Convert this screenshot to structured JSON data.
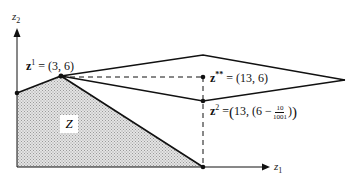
{
  "axes": {
    "x_label": "z",
    "x_sub": "1",
    "y_label": "z",
    "y_sub": "2"
  },
  "region_label": "Z",
  "points": {
    "z1": {
      "name": "z",
      "sup": "1",
      "value": "= (3, 6)"
    },
    "zss": {
      "name": "z",
      "sup": "**",
      "value": "= (13, 6)"
    },
    "z2": {
      "name": "z",
      "sup": "2",
      "eq": "=",
      "pre": "13, (6 −",
      "num": "10",
      "den": "1001",
      "post": ")"
    }
  },
  "colors": {
    "line": "#111111",
    "fill": "#cfcfcf",
    "background": "#ffffff"
  }
}
